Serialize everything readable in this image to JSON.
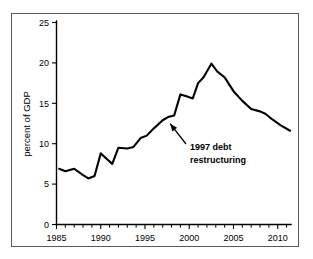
{
  "chart_data": {
    "type": "line",
    "title": "",
    "subtitle": "",
    "xlabel": "",
    "ylabel": "percent of GDP",
    "xlim": [
      1985,
      2011.5
    ],
    "ylim": [
      0,
      25
    ],
    "grid": false,
    "legend": "none",
    "x_ticks_major": [
      "1985",
      "1990",
      "1995",
      "2000",
      "2005",
      "2010"
    ],
    "x_ticks_major_values": [
      1985,
      1990,
      1995,
      2000,
      2005,
      2010
    ],
    "x_minor_tick_interval": 1,
    "y_ticks": [
      "0",
      "5",
      "10",
      "15",
      "20",
      "25"
    ],
    "y_tick_values": [
      0,
      5,
      10,
      15,
      20,
      25
    ],
    "series": [
      {
        "name": "public debt",
        "color": "#000000",
        "x": [
          1985.3,
          1986,
          1987,
          1988,
          1988.6,
          1989.3,
          1990,
          1990.5,
          1991.3,
          1992,
          1993,
          1993.7,
          1994.5,
          1995.2,
          1996,
          1997,
          1997.6,
          1998.3,
          1999,
          1999.6,
          2000.4,
          2001,
          2001.6,
          2002.5,
          2003.2,
          2004,
          2005,
          2006,
          2007,
          2008,
          2008.6,
          2009.4,
          2010.3,
          2011.4
        ],
        "values": [
          6.9,
          6.6,
          6.9,
          6.1,
          5.7,
          6.0,
          8.8,
          8.3,
          7.5,
          9.5,
          9.4,
          9.6,
          10.7,
          11.0,
          11.9,
          12.9,
          13.3,
          13.5,
          16.1,
          15.9,
          15.6,
          17.5,
          18.2,
          19.9,
          18.9,
          18.2,
          16.5,
          15.3,
          14.3,
          14.0,
          13.7,
          13.0,
          12.3,
          11.6
        ]
      }
    ],
    "annotations": [
      {
        "name": "1997-debt-restructuring",
        "line1": "1997 debt",
        "line2": "restructuring",
        "target_x": 1997.5,
        "target_y": 13.1,
        "bold": true
      }
    ]
  },
  "figure": {
    "border_color": "#5a5a5a",
    "background": "#ffffff",
    "line_color": "#000000"
  }
}
